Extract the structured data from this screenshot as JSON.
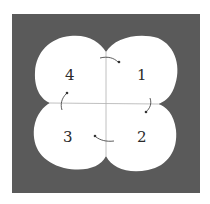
{
  "diagram": {
    "background_color": "#5a5a5a",
    "shape_color": "#ffffff",
    "axis_color": "#b0b0b0",
    "arrow_color": "#333333",
    "quadrants": [
      {
        "label": "1",
        "position": "top-right"
      },
      {
        "label": "2",
        "position": "bottom-right"
      },
      {
        "label": "3",
        "position": "bottom-left"
      },
      {
        "label": "4",
        "position": "top-left"
      }
    ],
    "rotation": "clockwise"
  }
}
